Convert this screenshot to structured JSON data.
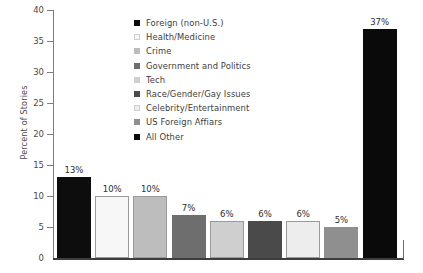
{
  "chart_data": {
    "type": "bar",
    "title": "",
    "xlabel": "",
    "ylabel": "Percent of Stories",
    "ylim": [
      0,
      40
    ],
    "yticks": [
      0,
      5,
      10,
      15,
      20,
      25,
      30,
      35,
      40
    ],
    "ytick_labels": [
      "0",
      "5",
      "10",
      "15",
      "20",
      "25",
      "30",
      "35",
      "40"
    ],
    "grid": false,
    "legend_position": "upper-center-inside",
    "categories": [
      "Foreign (non-U.S.)",
      "Health/Medicine",
      "Crime",
      "Government and Politics",
      "Tech",
      "Race/Gender/Gay Issues",
      "Celebrity/Entertainment",
      "US Foreign Affiars",
      "All Other"
    ],
    "values": [
      13,
      10,
      10,
      7,
      6,
      6,
      6,
      5,
      37
    ],
    "data_labels": [
      "13%",
      "10%",
      "10%",
      "7%",
      "6%",
      "6%",
      "6%",
      "5%",
      "37%"
    ],
    "colors": [
      "#0d0d0d",
      "#f7f7f7",
      "#bdbdbd",
      "#6e6e6e",
      "#cfcfcf",
      "#4a4a4a",
      "#ededed",
      "#8f8f8f",
      "#0a0a0a"
    ]
  },
  "legend": {
    "items": [
      {
        "label": "Foreign (non-U.S.)",
        "color": "#0d0d0d"
      },
      {
        "label": "Health/Medicine",
        "color": "#f7f7f7"
      },
      {
        "label": "Crime",
        "color": "#bdbdbd"
      },
      {
        "label": "Government and Politics",
        "color": "#6e6e6e"
      },
      {
        "label": "Tech",
        "color": "#cfcfcf"
      },
      {
        "label": "Race/Gender/Gay Issues",
        "color": "#4a4a4a"
      },
      {
        "label": "Celebrity/Entertainment",
        "color": "#ededed"
      },
      {
        "label": "US Foreign Affiars",
        "color": "#8f8f8f"
      },
      {
        "label": "All Other",
        "color": "#0a0a0a"
      }
    ]
  },
  "axis": {
    "y_title": "Percent of Stories",
    "y_labels": [
      "40",
      "35",
      "30",
      "25",
      "20",
      "15",
      "10",
      "5",
      "0"
    ]
  }
}
